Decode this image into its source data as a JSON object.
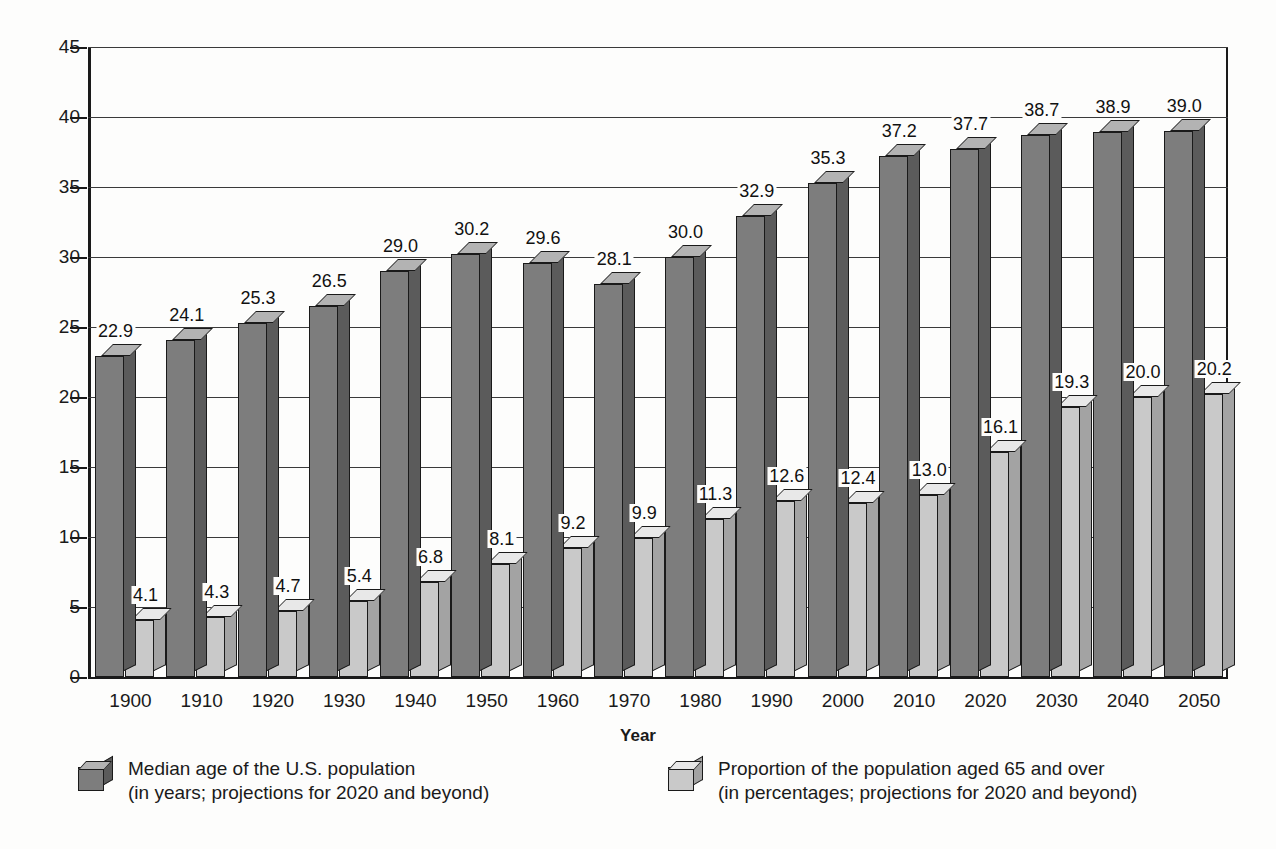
{
  "chart_data": {
    "type": "bar",
    "title": "",
    "subtitle": "",
    "xlabel": "Year",
    "ylabel": "",
    "ylim": [
      0,
      45
    ],
    "yticks": [
      0,
      5,
      10,
      15,
      20,
      25,
      30,
      35,
      40,
      45
    ],
    "grid": true,
    "legend_position": "bottom",
    "style": "3d-grouped-columns",
    "categories": [
      "1900",
      "1910",
      "1920",
      "1930",
      "1940",
      "1950",
      "1960",
      "1970",
      "1980",
      "1990",
      "2000",
      "2010",
      "2020",
      "2030",
      "2040",
      "2050"
    ],
    "series": [
      {
        "name": "Median age of the U.S. population",
        "units": "years",
        "color": "#7d7d7d",
        "values": [
          22.9,
          24.1,
          25.3,
          26.5,
          29.0,
          30.2,
          29.6,
          28.1,
          30.0,
          32.9,
          35.3,
          37.2,
          37.7,
          38.7,
          38.9,
          39.0
        ],
        "labels": [
          "22.9",
          "24.1",
          "25.3",
          "26.5",
          "29.0",
          "30.2",
          "29.6",
          "28.1",
          "30.0",
          "32.9",
          "35.3",
          "37.2",
          "37.7",
          "38.7",
          "38.9",
          "39.0"
        ]
      },
      {
        "name": "Proportion of the population aged 65 and over",
        "units": "percent",
        "color": "#c9c9c9",
        "values": [
          4.1,
          4.3,
          4.7,
          5.4,
          6.8,
          8.1,
          9.2,
          9.9,
          11.3,
          12.6,
          12.4,
          13.0,
          16.1,
          19.3,
          20.0,
          20.2
        ],
        "labels": [
          "4.1",
          "4.3",
          "4.7",
          "5.4",
          "6.8",
          "8.1",
          "9.2",
          "9.9",
          "11.3",
          "12.6",
          "12.4",
          "13.0",
          "16.1",
          "19.3",
          "20.0",
          "20.2"
        ]
      }
    ],
    "annotations": []
  },
  "legend": {
    "entries": [
      {
        "line1": "Median age of the U.S. population",
        "line2": "(in years; projections for 2020 and beyond)"
      },
      {
        "line1": "Proportion of the population aged 65 and over",
        "line2": "(in percentages; projections for 2020 and beyond)"
      }
    ]
  },
  "colors": {
    "series_dark": "#7d7d7d",
    "series_light": "#c9c9c9",
    "axis": "#1a1a1a",
    "gridline": "#3a3a3a",
    "background": "#fdfdfc"
  }
}
